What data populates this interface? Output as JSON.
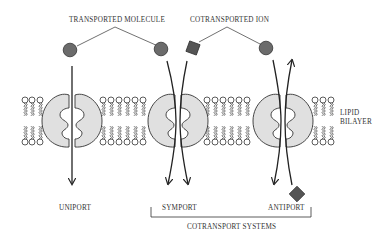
{
  "labels": {
    "transported_molecule": "TRANSPORTED MOLECULE",
    "cotransported_ion": "COTRANSPORTED ION",
    "lipid": "LIPID",
    "bilayer": "BILAYER",
    "uniport": "UNIPORT",
    "symport": "SYMPORT",
    "antiport": "ANTIPORT",
    "cotransport_systems": "COTRANSPORT SYSTEMS"
  },
  "colors": {
    "molecule": "#6b6b6b",
    "ion": "#555555",
    "protein": "#e0e0e0",
    "line": "#222222"
  }
}
